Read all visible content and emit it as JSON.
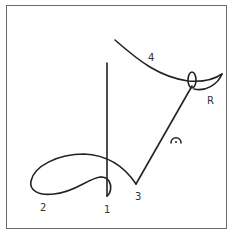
{
  "diagram": {
    "type": "stroke-sequence",
    "labels": {
      "stroke1": "1",
      "stroke2": "2",
      "stroke3": "3",
      "stroke4": "4",
      "release": "R"
    },
    "colors": {
      "stroke": "#222222",
      "frame": "#6a6a6a",
      "background": "#ffffff"
    }
  }
}
